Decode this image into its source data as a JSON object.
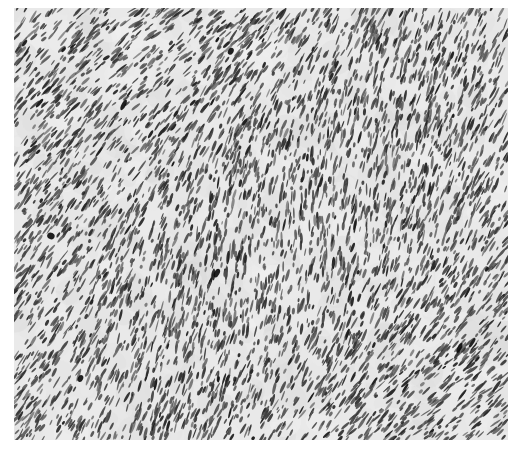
{
  "image": {
    "kind": "histology-micrograph",
    "description": "Grayscale photomicrograph of densely packed spindle-shaped cells in interlacing fascicles",
    "frame": {
      "left": 14,
      "top": 8,
      "width": 494,
      "height": 432
    },
    "background_color": "#ffffff",
    "field_color": "#e9e9e9",
    "nucleus_color_dark": "#1a1a1a",
    "nucleus_color_light": "#6a6a6a",
    "dominant_angle_deg": -62,
    "angle_jitter_deg": 22,
    "nucleus_count": 5200,
    "nucleus_length_range": [
      4,
      14
    ],
    "nucleus_width_range": [
      1.2,
      3.2
    ],
    "seed": 1337
  }
}
